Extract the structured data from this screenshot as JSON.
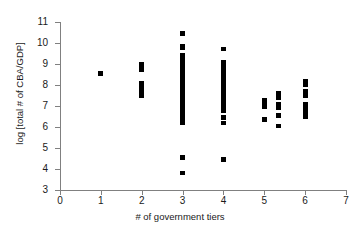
{
  "chart_data": {
    "type": "scatter",
    "title": "",
    "xlabel": "# of government tiers",
    "ylabel": "log [total # of CBA/GDP]",
    "xlim": [
      0,
      7
    ],
    "ylim": [
      3,
      11
    ],
    "xticks": [
      0,
      1,
      2,
      3,
      4,
      5,
      6,
      7
    ],
    "yticks": [
      3,
      4,
      5,
      6,
      7,
      8,
      9,
      10,
      11
    ],
    "grid": false,
    "legend": null,
    "marker": "square",
    "marker_color": "#000000",
    "points": [
      {
        "x": 1,
        "y": 8.55
      },
      {
        "x": 2,
        "y": 9.0
      },
      {
        "x": 2,
        "y": 8.9
      },
      {
        "x": 2,
        "y": 8.8
      },
      {
        "x": 2,
        "y": 8.7
      },
      {
        "x": 2,
        "y": 8.1
      },
      {
        "x": 2,
        "y": 8.0
      },
      {
        "x": 2,
        "y": 7.9
      },
      {
        "x": 2,
        "y": 7.8
      },
      {
        "x": 2,
        "y": 7.7
      },
      {
        "x": 2,
        "y": 7.6
      },
      {
        "x": 2,
        "y": 7.5
      },
      {
        "x": 3,
        "y": 10.45
      },
      {
        "x": 3,
        "y": 9.85
      },
      {
        "x": 3,
        "y": 9.75
      },
      {
        "x": 3,
        "y": 9.4
      },
      {
        "x": 3,
        "y": 9.3
      },
      {
        "x": 3,
        "y": 9.2
      },
      {
        "x": 3,
        "y": 9.1
      },
      {
        "x": 3,
        "y": 9.0
      },
      {
        "x": 3,
        "y": 8.9
      },
      {
        "x": 3,
        "y": 8.8
      },
      {
        "x": 3,
        "y": 8.7
      },
      {
        "x": 3,
        "y": 8.6
      },
      {
        "x": 3,
        "y": 8.5
      },
      {
        "x": 3,
        "y": 8.4
      },
      {
        "x": 3,
        "y": 8.3
      },
      {
        "x": 3,
        "y": 8.2
      },
      {
        "x": 3,
        "y": 8.1
      },
      {
        "x": 3,
        "y": 8.0
      },
      {
        "x": 3,
        "y": 7.9
      },
      {
        "x": 3,
        "y": 7.8
      },
      {
        "x": 3,
        "y": 7.7
      },
      {
        "x": 3,
        "y": 7.6
      },
      {
        "x": 3,
        "y": 7.5
      },
      {
        "x": 3,
        "y": 7.4
      },
      {
        "x": 3,
        "y": 7.3
      },
      {
        "x": 3,
        "y": 7.2
      },
      {
        "x": 3,
        "y": 7.1
      },
      {
        "x": 3,
        "y": 7.0
      },
      {
        "x": 3,
        "y": 6.9
      },
      {
        "x": 3,
        "y": 6.75
      },
      {
        "x": 3,
        "y": 6.6
      },
      {
        "x": 3,
        "y": 6.35
      },
      {
        "x": 3,
        "y": 6.2
      },
      {
        "x": 3,
        "y": 4.55
      },
      {
        "x": 3,
        "y": 3.8
      },
      {
        "x": 4,
        "y": 9.7
      },
      {
        "x": 4,
        "y": 9.1
      },
      {
        "x": 4,
        "y": 9.0
      },
      {
        "x": 4,
        "y": 8.9
      },
      {
        "x": 4,
        "y": 8.8
      },
      {
        "x": 4,
        "y": 8.7
      },
      {
        "x": 4,
        "y": 8.6
      },
      {
        "x": 4,
        "y": 8.5
      },
      {
        "x": 4,
        "y": 8.4
      },
      {
        "x": 4,
        "y": 8.3
      },
      {
        "x": 4,
        "y": 8.2
      },
      {
        "x": 4,
        "y": 8.1
      },
      {
        "x": 4,
        "y": 8.0
      },
      {
        "x": 4,
        "y": 7.9
      },
      {
        "x": 4,
        "y": 7.8
      },
      {
        "x": 4,
        "y": 7.7
      },
      {
        "x": 4,
        "y": 7.6
      },
      {
        "x": 4,
        "y": 7.5
      },
      {
        "x": 4,
        "y": 7.4
      },
      {
        "x": 4,
        "y": 7.3
      },
      {
        "x": 4,
        "y": 7.2
      },
      {
        "x": 4,
        "y": 7.1
      },
      {
        "x": 4,
        "y": 6.9
      },
      {
        "x": 4,
        "y": 6.75
      },
      {
        "x": 4,
        "y": 6.45
      },
      {
        "x": 4,
        "y": 6.2
      },
      {
        "x": 4,
        "y": 4.45
      },
      {
        "x": 5,
        "y": 7.3
      },
      {
        "x": 5,
        "y": 7.15
      },
      {
        "x": 5,
        "y": 6.95
      },
      {
        "x": 5,
        "y": 6.35
      },
      {
        "x": 5.35,
        "y": 7.6
      },
      {
        "x": 5.35,
        "y": 7.5
      },
      {
        "x": 5.35,
        "y": 7.4
      },
      {
        "x": 5.35,
        "y": 7.1
      },
      {
        "x": 5.35,
        "y": 7.0
      },
      {
        "x": 5.35,
        "y": 6.9
      },
      {
        "x": 5.35,
        "y": 6.55
      },
      {
        "x": 5.35,
        "y": 6.05
      },
      {
        "x": 6,
        "y": 8.2
      },
      {
        "x": 6,
        "y": 8.1
      },
      {
        "x": 6,
        "y": 8.0
      },
      {
        "x": 6,
        "y": 7.7
      },
      {
        "x": 6,
        "y": 7.6
      },
      {
        "x": 6,
        "y": 7.5
      },
      {
        "x": 6,
        "y": 7.1
      },
      {
        "x": 6,
        "y": 7.0
      },
      {
        "x": 6,
        "y": 6.9
      },
      {
        "x": 6,
        "y": 6.7
      },
      {
        "x": 6,
        "y": 6.6
      },
      {
        "x": 6,
        "y": 6.5
      }
    ]
  }
}
